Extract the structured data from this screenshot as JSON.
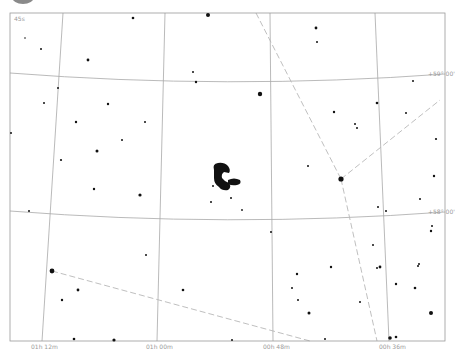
{
  "chart": {
    "fov_label": "45s",
    "frame": {
      "x": 10,
      "y": 13,
      "w": 435,
      "h": 328
    },
    "colors": {
      "background": "#ffffff",
      "grid": "#a8a8a8",
      "constellation": "#b8b8b8",
      "star": "#111111",
      "frame": "#999999"
    },
    "dec_labels": [
      {
        "text": "+59° 00'",
        "x": 428,
        "y": 76
      },
      {
        "text": "+58° 00'",
        "x": 428,
        "y": 214
      }
    ],
    "ra_labels": [
      {
        "text": "01h 12m",
        "x": 45,
        "y": 349
      },
      {
        "text": "01h 00m",
        "x": 160,
        "y": 349
      },
      {
        "text": "00h 48m",
        "x": 277,
        "y": 349
      },
      {
        "text": "00h 36m",
        "x": 393,
        "y": 349
      }
    ],
    "dso": {
      "name": "nebula",
      "x": 222,
      "y": 178
    }
  }
}
